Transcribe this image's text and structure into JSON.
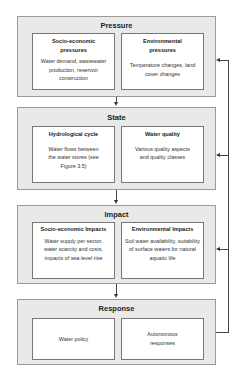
{
  "stages": [
    {
      "title": "Pressure",
      "boxes": [
        {
          "title": "Socio-economic pressures",
          "desc": "Water demand, wastewater production, reservoir construction"
        },
        {
          "title": "Environmental pressures",
          "desc": "Temperature changes, land cover changes"
        }
      ]
    },
    {
      "title": "State",
      "boxes": [
        {
          "title": "Hydrological cycle",
          "desc": "Water flows between the water stores (see Figure 3.5)"
        },
        {
          "title": "Water quality",
          "desc": "Various quality aspects and quality classes"
        }
      ]
    },
    {
      "title": "Impact",
      "boxes": [
        {
          "title": "Socio-economic Impacts",
          "desc": "Water supply per sector, water scarcity and costs, impacts of sea-level rise"
        },
        {
          "title": "Environmental Impacts",
          "desc": "Soil water availability, suitability of surface waters for natural aquatic life"
        }
      ]
    },
    {
      "title": "Response",
      "boxes": [
        {
          "title": "",
          "desc": "Water policy"
        },
        {
          "title": "",
          "desc": "Autonomous responses"
        }
      ]
    }
  ],
  "colors": {
    "outer_fill": "#e9e9e9",
    "inner_fill": "#ffffff",
    "line": "#444444"
  }
}
